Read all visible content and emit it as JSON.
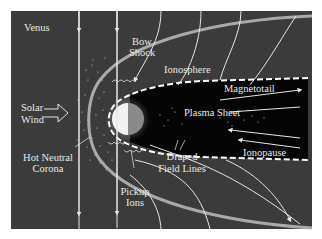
{
  "colors": {
    "background": "#ffffff",
    "panel": "#3b3b3b",
    "magnetotail": "#050505",
    "field_line": "#e6e6e6",
    "bow_shock": "#bfbfbf",
    "planet_day": "#f2f2f2",
    "planet_night": "#8a8a8a",
    "text": "#eeeeee"
  },
  "labels": {
    "venus": "Venus",
    "bow_shock_1": "Bow",
    "bow_shock_2": "Shock",
    "ionosphere": "Ionosphere",
    "solar_wind_1": "Solar",
    "solar_wind_2": "Wind",
    "magnetotail": "Magnetotail",
    "plasma_sheet": "Plasma Sheet",
    "hot_neutral_corona_1": "Hot Neutral",
    "hot_neutral_corona_2": "Corona",
    "draped_field_lines_1": "Draped",
    "draped_field_lines_2": "Field Lines",
    "ionopause": "Ionopause",
    "pickup_ions_1": "Pickup",
    "pickup_ions_2": "Ions"
  }
}
